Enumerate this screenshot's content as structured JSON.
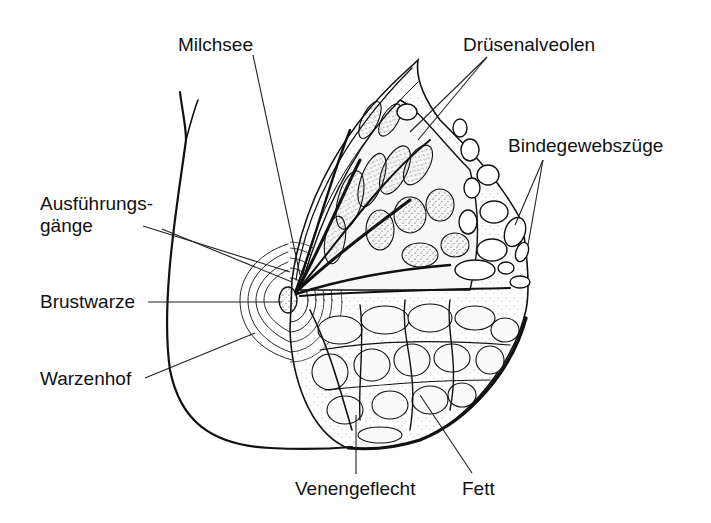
{
  "diagram": {
    "labels": {
      "milchsee": "Milchsee",
      "druesenalveolen": "Drüsenalveolen",
      "bindegewebszuege": "Bindegewebszüge",
      "ausfuehrungsgaenge_1": "Ausführungs-",
      "ausfuehrungsgaenge_2": "gänge",
      "brustwarze": "Brustwarze",
      "warzenhof": "Warzenhof",
      "venengeflecht": "Venengeflecht",
      "fett": "Fett"
    },
    "colors": {
      "ink": "#111111",
      "background": "#ffffff"
    }
  }
}
